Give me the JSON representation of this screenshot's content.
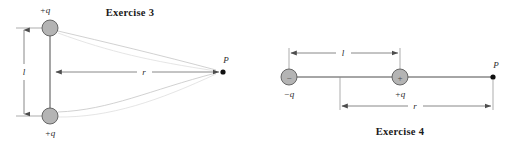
{
  "figure": {
    "type": "physics-diagram",
    "panels": [
      {
        "id": "exercise-3",
        "title": "Exercise 3",
        "description": "Two equal positive point charges separated vertically by distance l, with field point P at horizontal distance r from the midpoint.",
        "charges": [
          {
            "label": "+q",
            "sign": "+",
            "position": "top",
            "sign_glyph": ""
          },
          {
            "label": "+q",
            "sign": "+",
            "position": "bottom",
            "sign_glyph": ""
          }
        ],
        "dimensions": [
          {
            "label": "l",
            "orientation": "vertical",
            "meaning": "separation between the two charges"
          },
          {
            "label": "r",
            "orientation": "horizontal",
            "meaning": "distance from midpoint to point P"
          }
        ],
        "point": {
          "label": "P"
        }
      },
      {
        "id": "exercise-4",
        "title": "Exercise 4",
        "description": "An electric dipole: a negative charge and a positive charge separated by distance l, with field point P at distance r from the positive charge.",
        "charges": [
          {
            "label": "−q",
            "sign": "−",
            "position": "left",
            "sign_glyph": "−"
          },
          {
            "label": "+q",
            "sign": "+",
            "position": "middle",
            "sign_glyph": "+"
          }
        ],
        "dimensions": [
          {
            "label": "l",
            "orientation": "horizontal",
            "meaning": "separation between the charges"
          },
          {
            "label": "r",
            "orientation": "horizontal",
            "meaning": "distance from positive charge to point P"
          }
        ],
        "point": {
          "label": "P"
        }
      }
    ]
  },
  "colors": {
    "background": "#ffffff",
    "charge_fill": "#b4b4b4",
    "charge_stroke": "#5a5a5a",
    "line": "#4d4d4d",
    "field_line": "#c9c9c9",
    "text": "#1a1a1a",
    "dot": "#111111"
  },
  "labels": {
    "ex3_title": "Exercise 3",
    "ex3_charge_top": "+q",
    "ex3_charge_bottom": "+q",
    "ex3_dim_l": "l",
    "ex3_dim_r": "r",
    "ex3_point_p": "P",
    "ex4_title": "Exercise 4",
    "ex4_charge_left": "−q",
    "ex4_charge_left_sign": "−",
    "ex4_charge_middle": "+q",
    "ex4_charge_middle_sign": "+",
    "ex4_dim_l": "l",
    "ex4_dim_r": "r",
    "ex4_point_p": "P"
  }
}
